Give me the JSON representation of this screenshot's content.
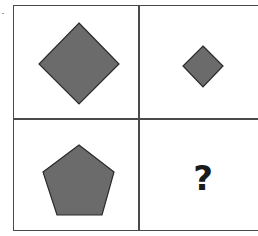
{
  "puzzle": {
    "rows": 2,
    "cols": 2,
    "shape_fill": "#6b6b6b",
    "shape_stroke": "#2a2a2a",
    "grid_color": "#4a4a4a",
    "cells": [
      {
        "position": "top-left",
        "shape": "diamond",
        "size": "large"
      },
      {
        "position": "top-right",
        "shape": "diamond",
        "size": "small"
      },
      {
        "position": "bottom-left",
        "shape": "pentagon",
        "size": "large"
      },
      {
        "position": "bottom-right",
        "shape": "unknown",
        "label": "?"
      }
    ]
  }
}
